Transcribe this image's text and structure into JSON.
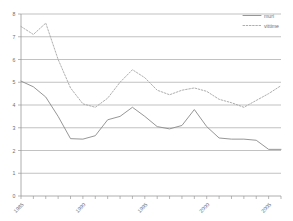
{
  "chart_data": {
    "type": "line",
    "title": "",
    "subtitle": "",
    "xlabel": "",
    "ylabel": "",
    "xlim": [
      1985,
      2006
    ],
    "ylim": [
      0,
      8
    ],
    "grid": true,
    "grid_axis": "y",
    "legend_position": "top-right",
    "x": [
      1985,
      1986,
      1987,
      1988,
      1989,
      1990,
      1991,
      1992,
      1993,
      1994,
      1995,
      1996,
      1997,
      1998,
      1999,
      2000,
      2001,
      2002,
      2003,
      2004,
      2005,
      2006
    ],
    "series": [
      {
        "name": "muri",
        "style": "solid",
        "color": "#8a8a8a",
        "values": [
          5.05,
          4.8,
          4.35,
          3.5,
          2.52,
          2.5,
          2.65,
          3.35,
          3.5,
          3.9,
          3.5,
          3.05,
          2.95,
          3.1,
          3.8,
          3.05,
          2.55,
          2.5,
          2.5,
          2.45,
          2.05,
          2.05
        ]
      },
      {
        "name": "vittime",
        "style": "dotted",
        "color": "#a5a5a5",
        "values": [
          7.45,
          7.1,
          7.6,
          6.0,
          4.75,
          4.05,
          3.9,
          4.3,
          5.0,
          5.55,
          5.2,
          4.65,
          4.45,
          4.65,
          4.75,
          4.6,
          4.25,
          4.1,
          3.9,
          4.2,
          4.5,
          4.85
        ]
      }
    ],
    "yticks": [
      0,
      1,
      2,
      3,
      4,
      5,
      6,
      7,
      8
    ],
    "ytick_labels": [
      "0",
      "1",
      "2",
      "3",
      "4",
      "5",
      "6",
      "7",
      "8"
    ],
    "xticks": [
      1985,
      1990,
      1995,
      2000,
      2005
    ],
    "xtick_labels": [
      "1985",
      "1990",
      "1995",
      "2000",
      "2005"
    ],
    "legend": [
      {
        "label": "muri",
        "style": "solid"
      },
      {
        "label": "vittime",
        "style": "dotted"
      }
    ]
  },
  "legend": {
    "entry_one_label": "muri",
    "entry_two_label": "vittime"
  },
  "axes": {
    "y_tick_0": "0",
    "y_tick_1": "1",
    "y_tick_2": "2",
    "y_tick_3": "3",
    "y_tick_4": "4",
    "y_tick_5": "5",
    "y_tick_6": "6",
    "y_tick_7": "7",
    "y_tick_8": "8",
    "x_tick_1985": "1985",
    "x_tick_1990": "1990",
    "x_tick_1995": "1995",
    "x_tick_2000": "2000",
    "x_tick_2005": "2005"
  }
}
